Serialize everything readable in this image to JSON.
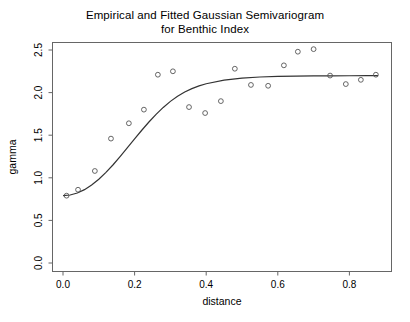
{
  "chart_data": {
    "type": "scatter",
    "title": "Empirical and Fitted Gaussian Semivariogram\nfor Benthic Index",
    "title_line1": "Empirical and Fitted Gaussian Semivariogram",
    "title_line2": "for Benthic Index",
    "xlabel": "distance",
    "ylabel": "gamma",
    "xlim": [
      -0.02,
      0.9
    ],
    "ylim": [
      0.0,
      2.6
    ],
    "xticks": [
      0.0,
      0.2,
      0.4,
      0.6,
      0.8
    ],
    "xtick_labels": [
      "0.0",
      "0.2",
      "0.4",
      "0.6",
      "0.8"
    ],
    "yticks": [
      0.0,
      0.5,
      1.0,
      1.5,
      2.0,
      2.5
    ],
    "ytick_labels": [
      "0.0",
      "0.5",
      "1.0",
      "1.5",
      "2.0",
      "2.5"
    ],
    "grid": false,
    "legend": null,
    "point_marker": "open-circle",
    "point_color": "#555555",
    "line_color": "#333333",
    "frame_color": "#666666",
    "series": [
      {
        "name": "Empirical semivariogram",
        "type": "scatter",
        "x": [
          0.01,
          0.042,
          0.089,
          0.134,
          0.184,
          0.226,
          0.265,
          0.307,
          0.352,
          0.397,
          0.441,
          0.48,
          0.525,
          0.573,
          0.617,
          0.656,
          0.7,
          0.746,
          0.79,
          0.832,
          0.874
        ],
        "y": [
          0.79,
          0.86,
          1.08,
          1.46,
          1.64,
          1.8,
          2.21,
          2.25,
          1.83,
          1.76,
          1.9,
          2.28,
          2.09,
          2.08,
          2.32,
          2.48,
          2.51,
          2.2,
          2.1,
          2.15,
          2.21
        ]
      },
      {
        "name": "Fitted Gaussian model",
        "type": "line",
        "nugget": 0.79,
        "sill": 2.2,
        "range": 0.27,
        "x": [
          0.0,
          0.02,
          0.04,
          0.06,
          0.08,
          0.1,
          0.12,
          0.14,
          0.16,
          0.18,
          0.2,
          0.22,
          0.24,
          0.26,
          0.28,
          0.3,
          0.32,
          0.34,
          0.36,
          0.38,
          0.4,
          0.45,
          0.5,
          0.55,
          0.6,
          0.65,
          0.7,
          0.75,
          0.8,
          0.85,
          0.88
        ],
        "y": [
          0.79,
          0.798,
          0.822,
          0.861,
          0.915,
          0.983,
          1.063,
          1.153,
          1.251,
          1.353,
          1.456,
          1.558,
          1.655,
          1.745,
          1.826,
          1.897,
          1.957,
          2.007,
          2.047,
          2.079,
          2.104,
          2.146,
          2.17,
          2.183,
          2.19,
          2.194,
          2.196,
          2.197,
          2.198,
          2.199,
          2.199
        ]
      }
    ]
  }
}
